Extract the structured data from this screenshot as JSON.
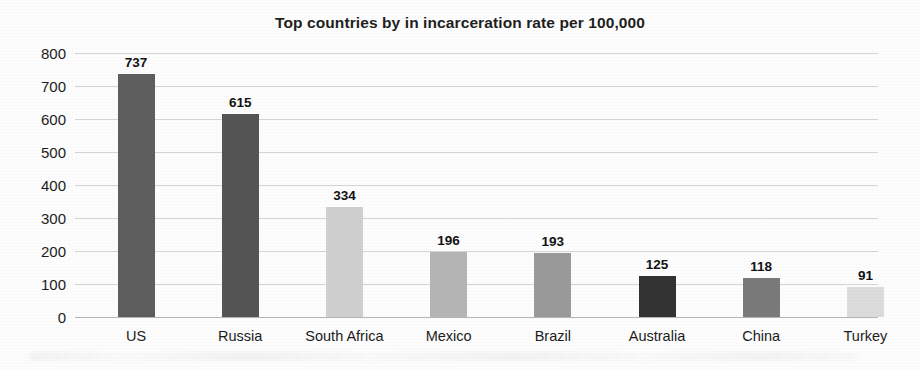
{
  "chart_data": {
    "type": "bar",
    "title": "Top countries by in incarceration rate per 100,000",
    "xlabel": "",
    "ylabel": "",
    "categories": [
      "US",
      "Russia",
      "South Africa",
      "Mexico",
      "Brazil",
      "Australia",
      "China",
      "Turkey"
    ],
    "values": [
      737,
      615,
      334,
      196,
      193,
      125,
      118,
      91
    ],
    "value_labels": [
      "737",
      "615",
      "334",
      "196",
      "193",
      "125",
      "118",
      "91"
    ],
    "ylim": [
      0,
      800
    ],
    "yticks": [
      0,
      100,
      200,
      300,
      400,
      500,
      600,
      700,
      800
    ],
    "ytick_labels": [
      "0",
      "100",
      "200",
      "300",
      "400",
      "500",
      "600",
      "700",
      "800"
    ],
    "grid": true,
    "legend": false,
    "legend_position": "none",
    "bar_colors": [
      "#5e5e5e",
      "#555555",
      "#d0d0d0",
      "#b5b5b5",
      "#9a9a9a",
      "#333333",
      "#7a7a7a",
      "#dcdcdc"
    ],
    "colors": {
      "background": "#fdfdfd",
      "gridline": "#d4d4d4",
      "axis": "#b4b4b4",
      "text": "#1c1c1c",
      "title": "#1f1f1f"
    }
  }
}
